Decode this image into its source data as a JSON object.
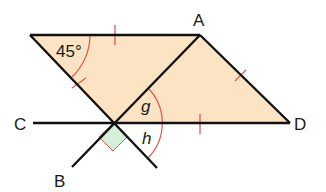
{
  "diagram": {
    "title": "",
    "points": {
      "A": {
        "label": "A",
        "x": 200,
        "y": 35
      },
      "D": {
        "label": "D",
        "x": 290,
        "y": 123
      },
      "C": {
        "label": "C",
        "x": 33,
        "y": 123
      },
      "B": {
        "label": "B",
        "x": 72,
        "y": 167
      },
      "TL": {
        "label": "",
        "x": 30,
        "y": 35
      },
      "X": {
        "label": "",
        "x": 113,
        "y": 123
      },
      "E": {
        "label": "",
        "x": 157,
        "y": 168
      }
    },
    "labels": {
      "A": "A",
      "B": "B",
      "C": "C",
      "D": "D",
      "angle_45": "45°",
      "angle_g": "g",
      "angle_h": "h"
    },
    "colors": {
      "fill": "#fbe3c4",
      "line": "#111111",
      "mark": "#e0584a",
      "right_angle_fill": "#d6efd8"
    }
  }
}
